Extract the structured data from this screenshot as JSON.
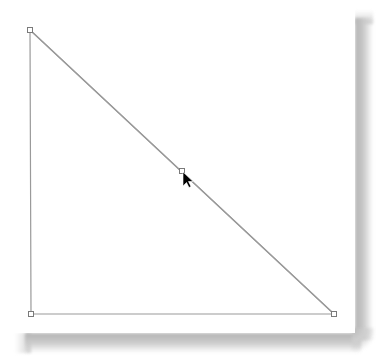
{
  "canvas": {
    "background": "#ffffff",
    "page_shadow_color": "#b4b4b4"
  },
  "shape": {
    "type": "right-triangle",
    "stroke_color": "#9a9a9a",
    "handle_stroke_color": "#7a7a7a",
    "handle_fill_color": "#ffffff",
    "vertices": [
      {
        "name": "top-left",
        "x": 30,
        "y": 30
      },
      {
        "name": "bottom-left",
        "x": 31,
        "y": 314
      },
      {
        "name": "bottom-right",
        "x": 334,
        "y": 314
      }
    ],
    "midpoint_handle": {
      "x": 182,
      "y": 171
    }
  },
  "cursor": {
    "type": "arrow",
    "x": 183,
    "y": 172,
    "color": "#000000"
  }
}
